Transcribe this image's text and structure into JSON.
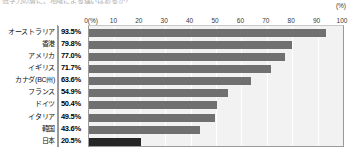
{
  "caption": "低学力の層に、地域による違いはあるか?",
  "unit_label": "(%)",
  "axis": {
    "first_tick": "0(%)",
    "ticks": [
      "0(%)",
      "10",
      "20",
      "30",
      "40",
      "50",
      "60",
      "70",
      "80",
      "90",
      "100"
    ],
    "values": [
      0,
      10,
      20,
      30,
      40,
      50,
      60,
      70,
      80,
      90,
      100
    ]
  },
  "colors": {
    "bar": "#707070",
    "bar_highlight": "#262626",
    "plot_background": "#f2f2f2",
    "gridline": "#ffffff",
    "axis_line": "#9a9a9a"
  },
  "chart_data": {
    "type": "bar",
    "orientation": "horizontal",
    "title": "低学力の層に、地域による違いはあるか?",
    "xlabel": "(%)",
    "ylabel": "",
    "xlim": [
      0,
      100
    ],
    "grid": true,
    "legend": "none",
    "categories": [
      "オーストラリア",
      "香港",
      "アメリカ",
      "イギリス",
      "カナダ(BC州)",
      "フランス",
      "ドイツ",
      "イタリア",
      "韓国",
      "日本"
    ],
    "values": [
      93.5,
      79.8,
      77.0,
      71.7,
      63.6,
      54.9,
      50.4,
      49.5,
      43.6,
      20.5
    ],
    "value_labels": [
      "93.5%",
      "79.8%",
      "77.0%",
      "71.7%",
      "63.6%",
      "54.9%",
      "50.4%",
      "49.5%",
      "43.6%",
      "20.5%"
    ],
    "highlight_index": 9
  }
}
